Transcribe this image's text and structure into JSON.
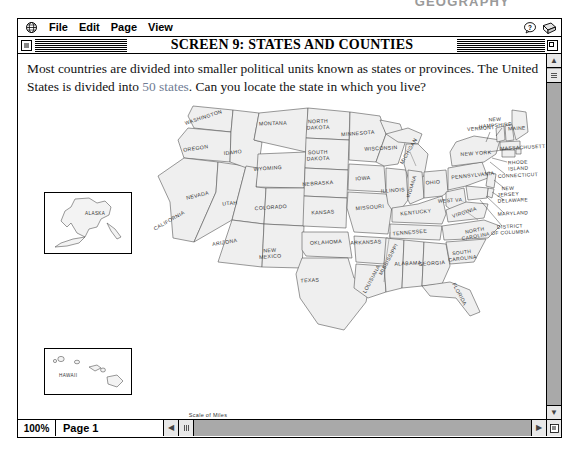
{
  "top_header": {
    "text": "GEOGRAPHY"
  },
  "menubar": {
    "apple_icon": "globe-icon",
    "items": [
      {
        "label": "File"
      },
      {
        "label": "Edit"
      },
      {
        "label": "Page"
      },
      {
        "label": "View"
      }
    ],
    "right_icons": [
      {
        "name": "help-icon",
        "glyph": "?"
      },
      {
        "name": "book-icon",
        "glyph": ""
      }
    ]
  },
  "titlebar": {
    "title": "SCREEN 9: STATES AND COUNTIES"
  },
  "body": {
    "line1_a": "Most countries are divided into smaller political units known as states or provinces. The",
    "line2_a": "United States is divided into ",
    "link": "50 states",
    "line2_b": ". Can you locate the state in which you live?",
    "link_color": "#6f7c93"
  },
  "map": {
    "scale": {
      "title": "Scale of Miles",
      "ticks": [
        "0",
        "500",
        "1000"
      ]
    },
    "insets": [
      {
        "name": "alaska-inset",
        "label": "ALASKA"
      },
      {
        "name": "hawaii-inset",
        "label": "HAWAII"
      }
    ],
    "state_labels": [
      {
        "name": "WASHINGTON",
        "x": 186,
        "y": 27,
        "rot": -18,
        "size": 5.2
      },
      {
        "name": "OREGON",
        "x": 178,
        "y": 58,
        "rot": -8,
        "size": 5.2
      },
      {
        "name": "CALIFORNIA",
        "x": 152,
        "y": 130,
        "rot": -30,
        "size": 5.2
      },
      {
        "name": "NEVADA",
        "x": 180,
        "y": 105,
        "rot": -14,
        "size": 5.2
      },
      {
        "name": "IDAHO",
        "x": 215,
        "y": 62,
        "rot": -7,
        "size": 5.2
      },
      {
        "name": "MONTANA",
        "x": 255,
        "y": 33,
        "rot": -2,
        "size": 5.2
      },
      {
        "name": "WYOMING",
        "x": 250,
        "y": 78,
        "rot": -4,
        "size": 5.2
      },
      {
        "name": "UTAH",
        "x": 212,
        "y": 113,
        "rot": -6,
        "size": 5.2
      },
      {
        "name": "COLORADO",
        "x": 253,
        "y": 117,
        "rot": -4,
        "size": 5.2
      },
      {
        "name": "ARIZONA",
        "x": 207,
        "y": 152,
        "rot": -9,
        "size": 5.2
      },
      {
        "name": "NEW MEXICO",
        "x": 252,
        "y": 160,
        "rot": -4,
        "size": 5.2
      },
      {
        "name": "NORTH DAKOTA",
        "x": 300,
        "y": 31,
        "rot": -2,
        "size": 5.2
      },
      {
        "name": "SOUTH DAKOTA",
        "x": 300,
        "y": 62,
        "rot": -2,
        "size": 5.2
      },
      {
        "name": "NEBRASKA",
        "x": 300,
        "y": 93,
        "rot": -4,
        "size": 5.2
      },
      {
        "name": "KANSAS",
        "x": 305,
        "y": 122,
        "rot": -3,
        "size": 5.2
      },
      {
        "name": "OKLAHOMA",
        "x": 308,
        "y": 152,
        "rot": -3,
        "size": 5.2
      },
      {
        "name": "TEXAS",
        "x": 292,
        "y": 190,
        "rot": -3,
        "size": 5.2
      },
      {
        "name": "MINNESOTA",
        "x": 340,
        "y": 43,
        "rot": -4,
        "size": 5.2
      },
      {
        "name": "IOWA",
        "x": 345,
        "y": 88,
        "rot": -3,
        "size": 5.2
      },
      {
        "name": "MISSOURI",
        "x": 352,
        "y": 117,
        "rot": -5,
        "size": 5.2
      },
      {
        "name": "ARKANSAS",
        "x": 348,
        "y": 152,
        "rot": -3,
        "size": 5.2
      },
      {
        "name": "LOUISIANA",
        "x": 355,
        "y": 188,
        "rot": -62,
        "size": 5.2
      },
      {
        "name": "WISCONSIN",
        "x": 363,
        "y": 58,
        "rot": -3,
        "size": 5.2
      },
      {
        "name": "ILLINOIS",
        "x": 375,
        "y": 100,
        "rot": -4,
        "size": 5.2
      },
      {
        "name": "MISSISSIPPI",
        "x": 372,
        "y": 168,
        "rot": -62,
        "size": 5.2
      },
      {
        "name": "ALABAMA",
        "x": 390,
        "y": 173,
        "rot": -3,
        "size": 5.2
      },
      {
        "name": "TENNESSEE",
        "x": 392,
        "y": 142,
        "rot": -5,
        "size": 5.2
      },
      {
        "name": "KENTUCKY",
        "x": 398,
        "y": 122,
        "rot": -6,
        "size": 5.2
      },
      {
        "name": "MICHIGAN",
        "x": 392,
        "y": 60,
        "rot": -60,
        "size": 5.2
      },
      {
        "name": "INDIANA",
        "x": 395,
        "y": 95,
        "rot": -72,
        "size": 5.0
      },
      {
        "name": "OHIO",
        "x": 415,
        "y": 92,
        "rot": -4,
        "size": 5.2
      },
      {
        "name": "GEORGIA",
        "x": 414,
        "y": 173,
        "rot": -4,
        "size": 5.2
      },
      {
        "name": "FLORIDA",
        "x": 440,
        "y": 203,
        "rot": 62,
        "size": 5.2
      },
      {
        "name": "WEST VA.",
        "x": 433,
        "y": 110,
        "rot": -3,
        "size": 5.0
      },
      {
        "name": "VIRGINIA",
        "x": 447,
        "y": 122,
        "rot": -18,
        "size": 5.2
      },
      {
        "name": "NORTH CAROLINA",
        "x": 457,
        "y": 140,
        "rot": -10,
        "size": 5.0
      },
      {
        "name": "SOUTH CAROLINA",
        "x": 444,
        "y": 162,
        "rot": -7,
        "size": 5.0
      },
      {
        "name": "PENNSYLVANIA",
        "x": 455,
        "y": 85,
        "rot": -6,
        "size": 5.2
      },
      {
        "name": "NEW YORK",
        "x": 458,
        "y": 63,
        "rot": -4,
        "size": 5.2
      },
      {
        "name": "VERMONT",
        "x": 463,
        "y": 38,
        "rot": -4,
        "size": 5.0
      },
      {
        "name": "NEW HAMPSHIRE",
        "x": 477,
        "y": 29,
        "rot": -4,
        "size": 5.0
      },
      {
        "name": "MAINE",
        "x": 499,
        "y": 38,
        "rot": -4,
        "size": 5.0
      },
      {
        "name": "MASSACHUSETT",
        "x": 505,
        "y": 57,
        "rot": -3,
        "size": 5.0
      },
      {
        "name": "RHODE ISLAND",
        "x": 500,
        "y": 72,
        "rot": -3,
        "size": 5.0
      },
      {
        "name": "CONNECTICUT",
        "x": 500,
        "y": 85,
        "rot": -3,
        "size": 5.0
      },
      {
        "name": "NEW JERSEY",
        "x": 490,
        "y": 98,
        "rot": -3,
        "size": 5.0
      },
      {
        "name": "DELAWARE",
        "x": 495,
        "y": 110,
        "rot": -3,
        "size": 5.0
      },
      {
        "name": "MARYLAND",
        "x": 495,
        "y": 123,
        "rot": -3,
        "size": 5.0
      },
      {
        "name": "DISTRICT OF COLUMBIA",
        "x": 492,
        "y": 136,
        "rot": -3,
        "size": 5.0
      }
    ]
  },
  "bottombar": {
    "zoom": "100%",
    "page": "Page 1"
  }
}
